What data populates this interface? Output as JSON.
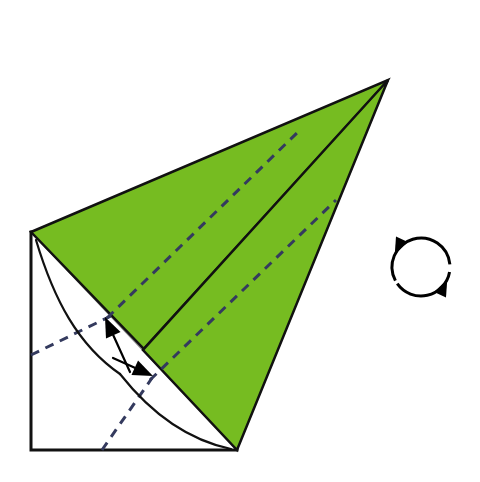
{
  "canvas": {
    "width": 480,
    "height": 482,
    "background_color": "#ffffff",
    "title": "Origami folding step diagram"
  },
  "palette": {
    "paper_front_green": "#76bc21",
    "paper_back_white": "#ffffff",
    "outline_black": "#111111",
    "crease_dashed_navy": "#343a5e",
    "thin_crease_gray": "#8d8d8d",
    "arrow_black": "#000000"
  },
  "figure": {
    "name": "folded-paper-figure",
    "base_square": {
      "name": "white-square-base",
      "fill": "#ffffff",
      "stroke": "#111111",
      "stroke_width": 3,
      "points": "31,232 237,232 237,450 31,450"
    },
    "green_upper_flap": {
      "name": "green-upper-flap",
      "fill": "#76bc21",
      "stroke": "#111111",
      "stroke_width": 2.5,
      "points": "31,232 388,80 240,360 143,348"
    },
    "green_lower_flap": {
      "name": "green-lower-flap",
      "fill": "#76bc21",
      "stroke": "#111111",
      "stroke_width": 2.5,
      "points": "388,80 237,450 143,350"
    },
    "center_crease": {
      "name": "center-spine-crease",
      "stroke": "#111111",
      "stroke_width": 1.6,
      "from": "388,80",
      "to": "143,349"
    },
    "diagonal_thin_crease": {
      "name": "diagonal-thin-crease",
      "stroke": "#8d8d8d",
      "stroke_width": 1.2,
      "from": "31,232",
      "to": "237,450"
    }
  },
  "creases": [
    {
      "name": "valley-crease-green-upper",
      "type": "valley-dashed",
      "color": "#343a5e",
      "from": "107,318",
      "to": "300,130"
    },
    {
      "name": "valley-crease-green-lower",
      "type": "valley-dashed",
      "color": "#343a5e",
      "from": "150,380",
      "to": "336,200"
    },
    {
      "name": "valley-crease-white-left",
      "type": "valley-dashed",
      "color": "#343a5e",
      "from": "31,355",
      "to": "111,316"
    },
    {
      "name": "valley-crease-white-bottom",
      "type": "valley-dashed",
      "color": "#343a5e",
      "from": "102,450",
      "to": "152,378"
    }
  ],
  "arcs": [
    {
      "name": "fold-arc-upper",
      "description": "curved reference arc from top-left corner sweeping down to the centre",
      "color": "#111111",
      "path": "M 36,240 C 54,300 78,345 120,374"
    },
    {
      "name": "fold-arc-lower",
      "description": "curved reference arc from centre sweeping down to the bottom-right corner",
      "color": "#111111",
      "path": "M 120,374 C 150,412 188,440 231,449"
    }
  ],
  "arrows": [
    {
      "name": "fold-arrow-up-left",
      "description": "solid arrow pointing up-left toward the green edge",
      "color": "#000000",
      "tail": "130,372",
      "head": "105,317",
      "head_angle_deg": -115
    },
    {
      "name": "fold-arrow-down-right",
      "description": "solid arrow pointing down-right toward the lower green edge",
      "color": "#000000",
      "tail": "113,358",
      "head": "153,376",
      "head_angle_deg": 24
    }
  ],
  "rotate_symbol": {
    "name": "rotate-symbol",
    "label": "rotate",
    "description": "circular two-headed arrow indicating rotating the model",
    "color": "#000000",
    "center_x": 421,
    "center_y": 267,
    "radius": 29,
    "stroke_width": 3
  }
}
